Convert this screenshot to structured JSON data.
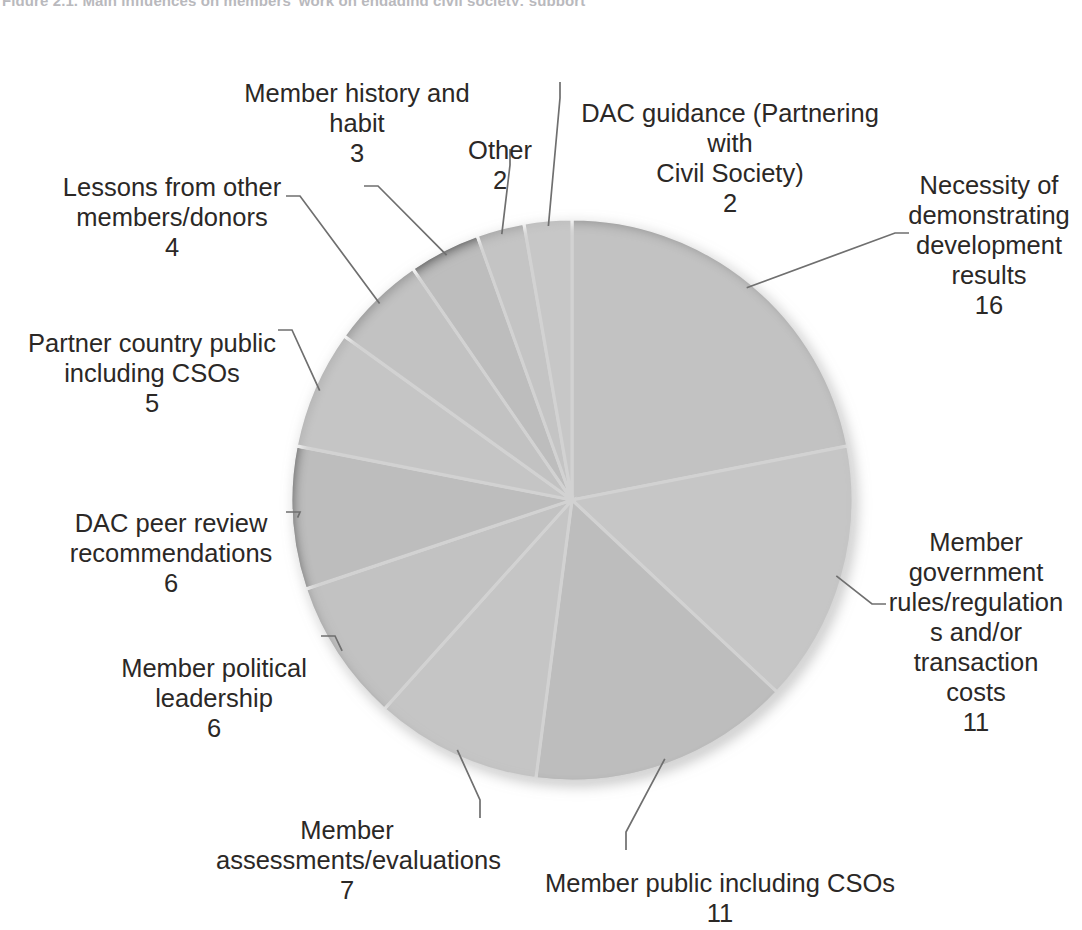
{
  "chart_title": "Figure 2.1. Main influences on members' work on engaging civil society: support",
  "chart_data": {
    "type": "pie",
    "title": "Main influences on members' work on engaging civil society",
    "total": 73,
    "start_angle_deg": 0,
    "direction": "clockwise",
    "legend": "none (direct labels with leader lines)",
    "grid": false,
    "categories": [
      "Necessity of demonstrating development results",
      "Member government rules/regulations and/or transaction costs",
      "Member public including CSOs",
      "Member assessments/evaluations",
      "Member political leadership",
      "DAC peer review recommendations",
      "Partner country public including CSOs",
      "Lessons from other members/donors",
      "Member history and habit",
      "Other",
      "DAC guidance (Partnering with Civil Society)"
    ],
    "values": [
      16,
      11,
      11,
      7,
      6,
      6,
      5,
      4,
      3,
      2,
      2
    ],
    "colors": [
      "#8f8f8f",
      "#b3b3b3",
      "#4f4f4f",
      "#a8a8a8",
      "#8a8a8a",
      "#4a4a4a",
      "#b0b0b0",
      "#949494",
      "#474747",
      "#a0a0a0",
      "#bcbcbc"
    ],
    "slice_separator_color": "#ffffff"
  },
  "labels": {
    "results": {
      "name": "Necessity of\ndemonstrating\ndevelopment\nresults",
      "value": "16"
    },
    "govrules": {
      "name": "Member\ngovernment\nrules/regulation\ns and/or\ntransaction\ncosts",
      "value": "11"
    },
    "pubcsos": {
      "name": "Member public including CSOs",
      "value": "11"
    },
    "assess": {
      "name": "Member\nassessments/evaluations",
      "value": "7"
    },
    "polit": {
      "name": "Member political\nleadership",
      "value": "6"
    },
    "peer": {
      "name": "DAC peer review\nrecommendations",
      "value": "6"
    },
    "partner": {
      "name": "Partner country public\nincluding CSOs",
      "value": "5"
    },
    "lessons": {
      "name": "Lessons from other\nmembers/donors",
      "value": "4"
    },
    "history": {
      "name": "Member history and\nhabit",
      "value": "3"
    },
    "other": {
      "name": "Other",
      "value": "2"
    },
    "dacguid": {
      "name": "DAC guidance (Partnering with\nCivil Society)",
      "value": "2"
    }
  }
}
